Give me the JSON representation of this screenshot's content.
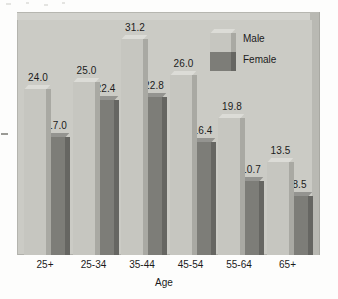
{
  "chart_data": {
    "type": "bar",
    "title": "",
    "subtitle": "",
    "xlabel": "Age",
    "ylabel": "",
    "grid": false,
    "ylim": [
      0,
      34
    ],
    "legend_position": "top-right",
    "style": "3d-grouped-column",
    "categories": [
      "25+",
      "25-34",
      "35-44",
      "45-54",
      "55-64",
      "65+"
    ],
    "series": [
      {
        "name": "Male",
        "color": "#c6c6c0",
        "values": [
          24.0,
          25.0,
          31.2,
          26.0,
          19.8,
          13.5
        ],
        "labels": [
          "24.0",
          "25.0",
          "31.2",
          "26.0",
          "19.8",
          "13.5"
        ]
      },
      {
        "name": "Female",
        "color": "#7d7d78",
        "values": [
          17.0,
          22.4,
          22.8,
          16.4,
          10.7,
          8.5
        ],
        "labels": [
          "17.0",
          "22.4",
          "22.8",
          "16.4",
          "10.7",
          "8.5"
        ]
      }
    ]
  },
  "legend": {
    "male_label": "Male",
    "female_label": "Female"
  },
  "axis": {
    "x_title": "Age"
  },
  "colors": {
    "plot_background": "#cbcbc5",
    "plot_top_face": "#d2d2cd",
    "plot_right_face": "#b9b9b3",
    "male_front": "#c6c6c0",
    "male_side": "#a9a9a3",
    "male_top": "#dcdcd7",
    "female_front": "#7d7d78",
    "female_side": "#666662",
    "female_top": "#949490",
    "text": "#1b1b1b",
    "page_background": "#fdfdfc"
  }
}
